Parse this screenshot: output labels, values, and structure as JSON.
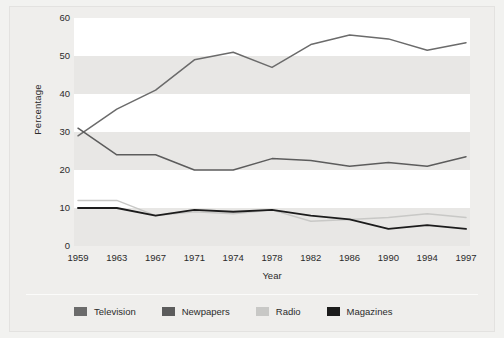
{
  "chart_data": {
    "type": "line",
    "title": "",
    "xlabel": "Year",
    "ylabel": "Percentage",
    "categories": [
      "1959",
      "1963",
      "1967",
      "1971",
      "1974",
      "1978",
      "1982",
      "1986",
      "1990",
      "1994",
      "1997"
    ],
    "x": [
      1959,
      1963,
      1967,
      1971,
      1974,
      1978,
      1982,
      1986,
      1990,
      1994,
      1997
    ],
    "ylim": [
      0,
      60
    ],
    "yticks": [
      0,
      10,
      20,
      30,
      40,
      50,
      60
    ],
    "grid": "horizontal-bands",
    "legend_position": "bottom",
    "series": [
      {
        "name": "Television",
        "color": "#6b6b6b",
        "values": [
          29,
          36,
          41,
          49,
          51,
          47,
          53,
          55.5,
          54.5,
          51.5,
          53.5
        ]
      },
      {
        "name": "Newpapers",
        "color": "#5c5c5c",
        "values": [
          31,
          24,
          24,
          20,
          20,
          23,
          22.5,
          21,
          22,
          21,
          23.5
        ]
      },
      {
        "name": "Radio",
        "color": "#c8c8c6",
        "values": [
          12,
          12,
          8,
          9,
          8.5,
          9.5,
          6.5,
          7,
          7.5,
          8.5,
          7.5
        ]
      },
      {
        "name": "Magazines",
        "color": "#1c1c1c",
        "values": [
          10,
          10,
          8,
          9.5,
          9,
          9.5,
          8,
          7,
          4.5,
          5.5,
          4.5
        ]
      }
    ]
  },
  "legend": {
    "items": [
      {
        "label": "Television",
        "color": "#6b6b6b"
      },
      {
        "label": "Newpapers",
        "color": "#5c5c5c"
      },
      {
        "label": "Radio",
        "color": "#c8c8c6"
      },
      {
        "label": "Magazines",
        "color": "#1c1c1c"
      }
    ]
  },
  "axes": {
    "y_title": "Percentage",
    "x_title": "Year",
    "y_ticks": [
      "0",
      "10",
      "20",
      "30",
      "40",
      "50",
      "60"
    ],
    "x_ticks": [
      "1959",
      "1963",
      "1967",
      "1971",
      "1974",
      "1978",
      "1982",
      "1986",
      "1990",
      "1994",
      "1997"
    ]
  },
  "colors": {
    "page_background": "#f2f2f0",
    "frame_background": "#efeeec",
    "band_light": "#ffffff",
    "band_gray": "#e8e7e5",
    "text": "#2b2b2b"
  }
}
